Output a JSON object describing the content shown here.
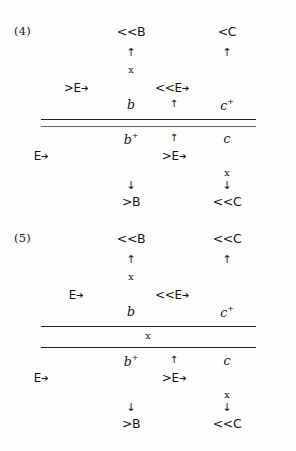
{
  "page": {
    "scan_header_text": "·· ····· ·· ···· ·······",
    "background_color": "#fdfdfd",
    "ink_color": "#151515"
  },
  "examples": [
    {
      "number": "(4)",
      "upper_block": {
        "tone_tier": [
          {
            "label": "<<B"
          },
          {
            "label": "<C"
          }
        ],
        "assoc_arrows_up": [
          {
            "glyph": "↑"
          },
          {
            "glyph": "↑"
          }
        ],
        "x_marks": [
          {
            "label": "x"
          }
        ],
        "e_items": [
          {
            "label": ">E",
            "arrow": "➔"
          },
          {
            "label": "<<E",
            "arrow": "➔"
          }
        ],
        "segment_tier": [
          {
            "label": "b",
            "sup": ""
          },
          {
            "label": "",
            "sup": "",
            "arrow_glyph": "↑"
          },
          {
            "label": "c",
            "sup": "+"
          }
        ]
      },
      "rules": {
        "count": 2,
        "label": ""
      },
      "lower_block": {
        "segment_tier": [
          {
            "label": "b",
            "sup": "+"
          },
          {
            "label": "",
            "arrow_glyph": "↑"
          },
          {
            "label": "c",
            "sup": ""
          }
        ],
        "e_items": [
          {
            "label": "E",
            "arrow": "➔"
          },
          {
            "label": ">E",
            "arrow": "➔"
          }
        ],
        "x_marks": [
          {
            "label": "x"
          }
        ],
        "assoc_arrows_down": [
          {
            "glyph": "↓"
          },
          {
            "glyph": "↓"
          }
        ],
        "tone_tier": [
          {
            "label": ">B"
          },
          {
            "label": "<<C"
          }
        ]
      }
    },
    {
      "number": "(5)",
      "upper_block": {
        "tone_tier": [
          {
            "label": "<<B"
          },
          {
            "label": "<<C"
          }
        ],
        "assoc_arrows_up": [
          {
            "glyph": "↑"
          },
          {
            "glyph": "↑"
          }
        ],
        "x_marks": [
          {
            "label": "x"
          }
        ],
        "e_items": [
          {
            "label": "E",
            "arrow": "➔"
          },
          {
            "label": "<<E",
            "arrow": "➔"
          }
        ],
        "segment_tier": [
          {
            "label": "b",
            "sup": ""
          },
          {
            "label": "c",
            "sup": "+"
          }
        ]
      },
      "rules": {
        "count": 2,
        "label": "x"
      },
      "lower_block": {
        "segment_tier": [
          {
            "label": "b",
            "sup": "+"
          },
          {
            "label": "",
            "arrow_glyph": "↑"
          },
          {
            "label": "c",
            "sup": ""
          }
        ],
        "e_items": [
          {
            "label": "E",
            "arrow": "➔"
          },
          {
            "label": ">E",
            "arrow": "➔"
          }
        ],
        "x_marks": [
          {
            "label": "x"
          }
        ],
        "assoc_arrows_down": [
          {
            "glyph": "↓"
          },
          {
            "glyph": "↓"
          }
        ],
        "tone_tier": [
          {
            "label": ">B"
          },
          {
            "label": "<<C"
          }
        ]
      }
    }
  ]
}
